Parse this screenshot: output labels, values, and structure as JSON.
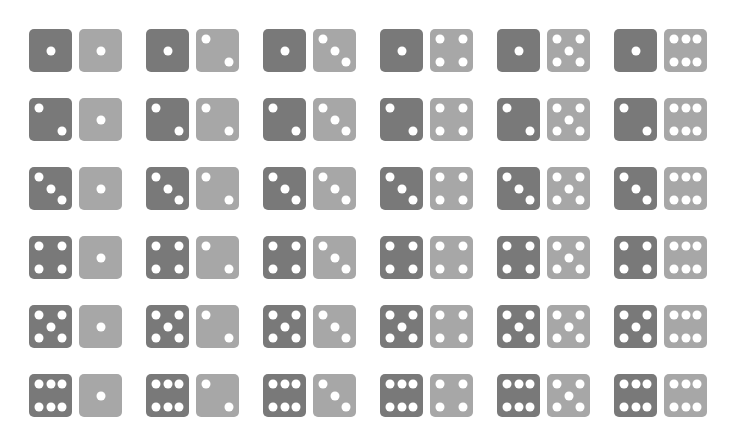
{
  "colors": {
    "dark_die": "#797979",
    "light_die": "#a7a7a7",
    "pip": "#ffffff",
    "background": "#ffffff"
  },
  "layout": {
    "rows": 6,
    "cols": 6,
    "col_x": [
      29,
      146,
      263,
      380,
      497,
      614
    ],
    "row_y": [
      29,
      98,
      167,
      236,
      305,
      374
    ]
  },
  "outcomes": [
    [
      {
        "dark": 1,
        "light": 1
      },
      {
        "dark": 1,
        "light": 2
      },
      {
        "dark": 1,
        "light": 3
      },
      {
        "dark": 1,
        "light": 4
      },
      {
        "dark": 1,
        "light": 5
      },
      {
        "dark": 1,
        "light": 6
      }
    ],
    [
      {
        "dark": 2,
        "light": 1
      },
      {
        "dark": 2,
        "light": 2
      },
      {
        "dark": 2,
        "light": 3
      },
      {
        "dark": 2,
        "light": 4
      },
      {
        "dark": 2,
        "light": 5
      },
      {
        "dark": 2,
        "light": 6
      }
    ],
    [
      {
        "dark": 3,
        "light": 1
      },
      {
        "dark": 3,
        "light": 2
      },
      {
        "dark": 3,
        "light": 3
      },
      {
        "dark": 3,
        "light": 4
      },
      {
        "dark": 3,
        "light": 5
      },
      {
        "dark": 3,
        "light": 6
      }
    ],
    [
      {
        "dark": 4,
        "light": 1
      },
      {
        "dark": 4,
        "light": 2
      },
      {
        "dark": 4,
        "light": 3
      },
      {
        "dark": 4,
        "light": 4
      },
      {
        "dark": 4,
        "light": 5
      },
      {
        "dark": 4,
        "light": 6
      }
    ],
    [
      {
        "dark": 5,
        "light": 1
      },
      {
        "dark": 5,
        "light": 2
      },
      {
        "dark": 5,
        "light": 3
      },
      {
        "dark": 5,
        "light": 4
      },
      {
        "dark": 5,
        "light": 5
      },
      {
        "dark": 5,
        "light": 6
      }
    ],
    [
      {
        "dark": 6,
        "light": 1
      },
      {
        "dark": 6,
        "light": 2
      },
      {
        "dark": 6,
        "light": 3
      },
      {
        "dark": 6,
        "light": 4
      },
      {
        "dark": 6,
        "light": 5
      },
      {
        "dark": 6,
        "light": 6
      }
    ]
  ]
}
